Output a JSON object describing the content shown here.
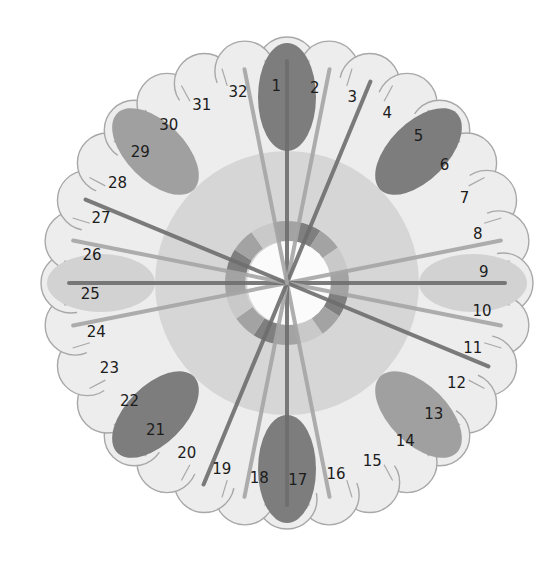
{
  "diagram": {
    "title": "",
    "center": {
      "x": 287,
      "y": 283
    },
    "petal_count": 32,
    "labels": [
      "1",
      "2",
      "3",
      "4",
      "5",
      "6",
      "7",
      "8",
      "9",
      "10",
      "11",
      "12",
      "13",
      "14",
      "15",
      "16",
      "17",
      "18",
      "19",
      "20",
      "21",
      "22",
      "23",
      "24",
      "25",
      "26",
      "27",
      "28",
      "29",
      "30",
      "31",
      "32"
    ],
    "highlight_ellipses": [
      {
        "position": 1,
        "shade": "dark"
      },
      {
        "position": 5,
        "shade": "dark"
      },
      {
        "position": 9,
        "shade": "light"
      },
      {
        "position": 13,
        "shade": "medium"
      },
      {
        "position": 17,
        "shade": "dark"
      },
      {
        "position": 21,
        "shade": "dark"
      },
      {
        "position": 25,
        "shade": "light"
      },
      {
        "position": 29,
        "shade": "medium"
      }
    ],
    "radial_lines_to": [
      1,
      2,
      3,
      8,
      9,
      10,
      11,
      16,
      17,
      18,
      19,
      24,
      25,
      26,
      27,
      32
    ],
    "colors": {
      "background": "#ffffff",
      "petal_fill": "#ededed",
      "petal_stroke": "#a8a8a8",
      "mid_disk": "#d6d6d6",
      "ring_dark": "#7f7f7f",
      "ring_mid": "#a3a3a3",
      "ring_light": "#c9c9c9",
      "center_fill": "#fbfbfb",
      "ellipse_dark": "#7d7d7d",
      "ellipse_medium": "#a0a0a0",
      "ellipse_light": "#d2d2d2",
      "line_dark": "#6e6e6e",
      "line_light": "#a6a6a6"
    }
  }
}
